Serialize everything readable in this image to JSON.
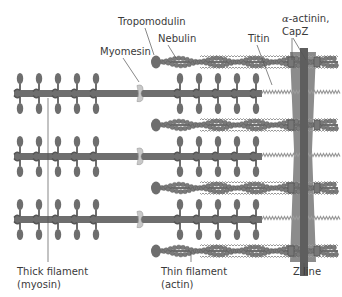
{
  "labels": {
    "tropomodulin": "Tropomodulin",
    "nebulin": "Nebulin",
    "myomesin": "Myomesin",
    "titin": "Titin",
    "alpha_actinin_prefix": "α",
    "alpha_actinin_rest": "-actinin,",
    "capz": "CapZ",
    "thick_filament_line1": "Thick filament",
    "thick_filament_line2": "(myosin)",
    "thin_filament_line1": "Thin filament",
    "thin_filament_line2": "(actin)",
    "z_line": "Z line"
  },
  "components": {
    "thick_filament_count": 3,
    "thin_filament_count": 4,
    "myosin_heads_per_side": 5
  },
  "colors": {
    "filament_dark": "#6e6e6e",
    "filament_mid": "#8a8a8a",
    "actin_bead": "#7a7a7a",
    "titin_spring": "#9a9a9a",
    "myomesin": "#c8c8c8",
    "zline_outer": "#8c8c8c",
    "zline_inner": "#5e5e5e",
    "leader": "#555555",
    "text": "#3a3a3a"
  }
}
